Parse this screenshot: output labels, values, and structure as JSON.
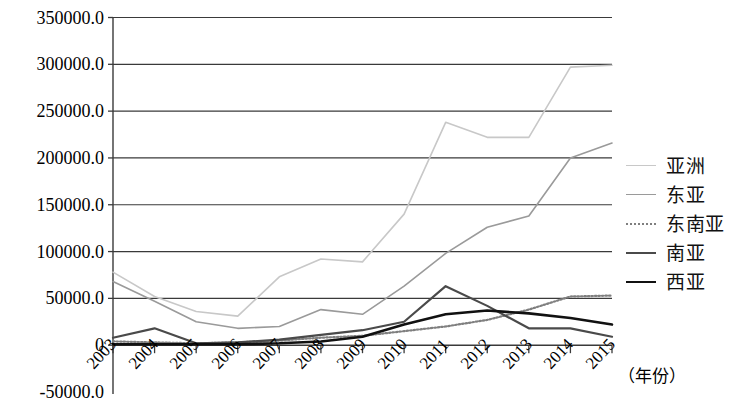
{
  "chart_data": {
    "type": "line",
    "title": "",
    "xlabel": "（年份）",
    "ylabel": "",
    "categories": [
      "2003",
      "2004",
      "2005",
      "2006",
      "2007",
      "2008",
      "2009",
      "2010",
      "2011",
      "2012",
      "2013",
      "2014",
      "2015"
    ],
    "ylim": [
      -50000,
      350000
    ],
    "ytick_labels": [
      "350000.0",
      "300000.0",
      "250000.0",
      "200000.0",
      "150000.0",
      "100000.0",
      "50000.0",
      "0",
      "-50000.0"
    ],
    "ytick_values": [
      350000,
      300000,
      250000,
      200000,
      150000,
      100000,
      50000,
      0,
      -50000
    ],
    "grid": "horizontal",
    "legend_position": "right",
    "series": [
      {
        "name": "亚洲",
        "color": "#c8c8c8",
        "style": "solid",
        "width": 1.6,
        "values": [
          78000,
          52000,
          36000,
          31000,
          73000,
          92000,
          89000,
          140000,
          238000,
          222000,
          222000,
          297000,
          318000
        ]
      },
      {
        "name": "东亚",
        "color": "#9a9a9a",
        "style": "solid",
        "width": 1.6,
        "values": [
          68000,
          47000,
          25000,
          18000,
          20000,
          38000,
          33000,
          63000,
          98000,
          126000,
          138000,
          200000,
          216000
        ]
      },
      {
        "name": "东南亚",
        "color": "#7f7f7f",
        "style": "dotted",
        "width": 2.2,
        "values": [
          4000,
          3000,
          2000,
          3000,
          5000,
          8000,
          10000,
          15000,
          20000,
          27000,
          38000,
          52000,
          61000
        ]
      },
      {
        "name": "南亚",
        "color": "#4a4a4a",
        "style": "solid",
        "width": 2.2,
        "values": [
          8000,
          18000,
          2000,
          3000,
          6000,
          11000,
          16000,
          25000,
          63000,
          42000,
          18000,
          18000,
          18000
        ]
      },
      {
        "name": "西亚",
        "color": "#111111",
        "style": "solid",
        "width": 2.6,
        "values": [
          1000,
          1000,
          1000,
          1000,
          2000,
          4000,
          9000,
          22000,
          33000,
          37000,
          34000,
          29000,
          20000
        ]
      }
    ],
    "series_values_2015": {
      "亚洲": 299000,
      "东亚": 216000,
      "东南亚": 53000,
      "南亚": 9000,
      "西亚": 22000
    }
  },
  "legend": {
    "items": [
      {
        "label": "亚洲"
      },
      {
        "label": "东亚"
      },
      {
        "label": "东南亚"
      },
      {
        "label": "南亚"
      },
      {
        "label": "西亚"
      }
    ]
  },
  "axes": {
    "x_axis_title": "（年份）"
  }
}
